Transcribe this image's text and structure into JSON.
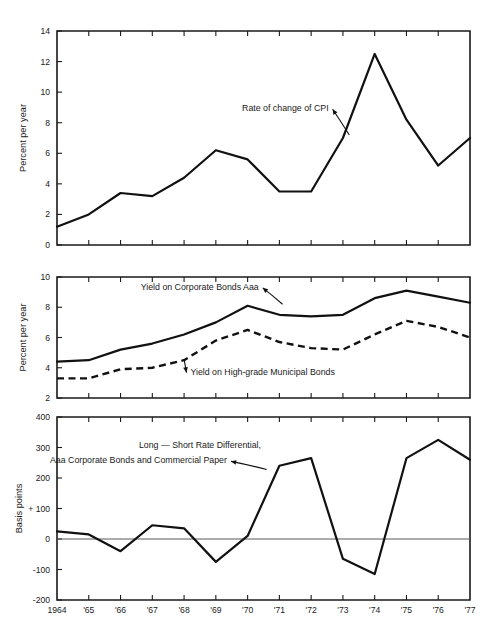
{
  "figure": {
    "background": "#ffffff",
    "ink_color": "#111111",
    "zero_line_color": "#55595c"
  },
  "x_axis": {
    "labels": [
      "1964",
      "'65",
      "'66",
      "'67",
      "'68",
      "'69",
      "'70",
      "'71",
      "'72",
      "'73",
      "'74",
      "'75",
      "'76",
      "'77"
    ],
    "years": [
      1964,
      1965,
      1966,
      1967,
      1968,
      1969,
      1970,
      1971,
      1972,
      1973,
      1974,
      1975,
      1976,
      1977
    ]
  },
  "chart_data": [
    {
      "type": "line",
      "panel": "top",
      "title": "",
      "xlabel": "",
      "ylabel": "Percent per year",
      "ylim": [
        0,
        14
      ],
      "yticks": [
        0,
        2,
        4,
        6,
        8,
        10,
        12,
        14
      ],
      "ytick_labels": [
        "0",
        "2",
        "4",
        "6",
        "8",
        "10",
        "12",
        "14"
      ],
      "grid": false,
      "legend_position": "inline-annotation",
      "categories": [
        "1964",
        "'65",
        "'66",
        "'67",
        "'68",
        "'69",
        "'70",
        "'71",
        "'72",
        "'73",
        "'74",
        "'75",
        "'76",
        "'77"
      ],
      "series": [
        {
          "name": "Rate of change of CPI",
          "style": "solid",
          "values": [
            1.2,
            2.0,
            3.4,
            3.2,
            4.4,
            6.2,
            5.6,
            3.5,
            3.5,
            7.0,
            12.5,
            8.2,
            5.2,
            7.0
          ]
        }
      ],
      "annotations": [
        {
          "text": "Rate of change of CPI",
          "x": 1972.55,
          "y": 8.75,
          "anchor": "end",
          "arrow_to_x": 1973.2,
          "arrow_to_y": 7.2
        }
      ]
    },
    {
      "type": "line",
      "panel": "middle",
      "title": "",
      "xlabel": "",
      "ylabel": "Percent per year",
      "ylim": [
        2,
        10
      ],
      "yticks": [
        2,
        4,
        6,
        8,
        10
      ],
      "ytick_labels": [
        "2",
        "4",
        "6",
        "8",
        "10"
      ],
      "grid": false,
      "legend_position": "inline-annotation",
      "categories": [
        "1964",
        "'65",
        "'66",
        "'67",
        "'68",
        "'69",
        "'70",
        "'71",
        "'72",
        "'73",
        "'74",
        "'75",
        "'76",
        "'77"
      ],
      "series": [
        {
          "name": "Yield on Corporate Bonds Aaa",
          "style": "solid",
          "values": [
            4.4,
            4.5,
            5.2,
            5.6,
            6.2,
            7.0,
            8.1,
            7.5,
            7.4,
            7.5,
            8.6,
            9.1,
            8.7,
            8.3
          ]
        },
        {
          "name": "Yield on High-grade Municipal Bonds",
          "style": "dashed",
          "values": [
            3.3,
            3.3,
            3.9,
            4.0,
            4.5,
            5.8,
            6.5,
            5.7,
            5.3,
            5.2,
            6.2,
            7.1,
            6.7,
            6.0
          ]
        }
      ],
      "annotations": [
        {
          "text": "Yield on Corporate Bonds Aaa",
          "x": 1970.35,
          "y": 9.15,
          "anchor": "end",
          "arrow_to_x": 1971.1,
          "arrow_to_y": 8.2
        },
        {
          "text": "Yield on High-grade Municipal Bonds",
          "x": 1968.2,
          "y": 3.55,
          "anchor": "start",
          "arrow_to_x": 1968.0,
          "arrow_to_y": 4.55
        }
      ]
    },
    {
      "type": "line",
      "panel": "bottom",
      "title": "",
      "xlabel": "",
      "ylabel": "Basis points",
      "ylim": [
        -200,
        400
      ],
      "yticks": [
        -200,
        -100,
        0,
        100,
        200,
        300,
        400
      ],
      "ytick_labels": [
        "-200",
        "-100",
        "0",
        "+ 100",
        "200",
        "300",
        "400"
      ],
      "grid": false,
      "zero_reference_line": 0,
      "legend_position": "inline-annotation",
      "categories": [
        "1964",
        "'65",
        "'66",
        "'67",
        "'68",
        "'69",
        "'70",
        "'71",
        "'72",
        "'73",
        "'74",
        "'75",
        "'76",
        "'77"
      ],
      "series": [
        {
          "name": "Long - Short Rate Differential, Aaa Corporate Bonds and Commercial Paper",
          "style": "solid",
          "values": [
            25,
            15,
            -40,
            45,
            35,
            -75,
            10,
            240,
            265,
            -65,
            -115,
            265,
            325,
            260
          ]
        }
      ],
      "annotations": [
        {
          "text": "Long — Short Rate Differential,",
          "x": 1968.5,
          "y": 300,
          "anchor": "middle"
        },
        {
          "text": "Aaa Corporate Bonds and Commercial Paper",
          "x": 1969.35,
          "y": 248,
          "anchor": "end",
          "arrow_to_x": 1970.6,
          "arrow_to_y": 228
        }
      ]
    }
  ]
}
